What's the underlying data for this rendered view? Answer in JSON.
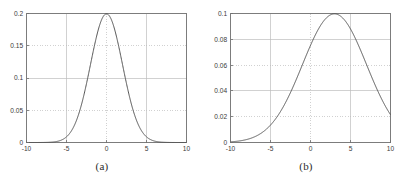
{
  "figure": {
    "panels": [
      {
        "caption": "(a)",
        "chart_data": {
          "type": "line",
          "title": "",
          "xlabel": "",
          "ylabel": "",
          "xlim": [
            -10,
            10
          ],
          "ylim": [
            0,
            0.2
          ],
          "xticks": [
            -10,
            -5,
            0,
            5,
            10
          ],
          "xticklabels": [
            "-10",
            "-5",
            "0",
            "5",
            "10"
          ],
          "yticks": [
            0,
            0.05,
            0.1,
            0.15,
            0.2
          ],
          "yticklabels": [
            "0",
            "0.05",
            "0.1",
            "0.15",
            "0.2"
          ],
          "grid": true,
          "grid_style": "dotted",
          "legend": null,
          "series": [
            {
              "name": "gaussian-pdf-mu0-sigma2",
              "mean": 0,
              "sigma": 2,
              "peak_value": 0.1995,
              "peak_x": 0,
              "color": "#4d4d4d",
              "x": [
                -10,
                -9.5,
                -9,
                -8.5,
                -8,
                -7.5,
                -7,
                -6.5,
                -6,
                -5.5,
                -5,
                -4.5,
                -4,
                -3.5,
                -3,
                -2.5,
                -2,
                -1.5,
                -1,
                -0.5,
                0,
                0.5,
                1,
                1.5,
                2,
                2.5,
                3,
                3.5,
                4,
                4.5,
                5,
                5.5,
                6,
                6.5,
                7,
                7.5,
                8,
                8.5,
                9,
                9.5,
                10
              ],
              "values": [
                0.0001,
                0.0002,
                0.0006,
                0.0014,
                0.0027,
                0.0051,
                0.0088,
                0.0145,
                0.0224,
                0.0325,
                0.044,
                0.0561,
                0.0675,
                0.077,
                0.0833,
                0.0863,
                0.088,
                0.0863,
                0.0833,
                0.077,
                0.1995,
                0.077,
                0.0833,
                0.0863,
                0.088,
                0.0863,
                0.0833,
                0.077,
                0.0675,
                0.0561,
                0.044,
                0.0325,
                0.0224,
                0.0145,
                0.0088,
                0.0051,
                0.0027,
                0.0014,
                0.0006,
                0.0002,
                0.0001
              ]
            }
          ]
        }
      },
      {
        "caption": "(b)",
        "chart_data": {
          "type": "line",
          "title": "",
          "xlabel": "",
          "ylabel": "",
          "xlim": [
            -10,
            10
          ],
          "ylim": [
            0,
            0.1
          ],
          "xticks": [
            -10,
            -5,
            0,
            5,
            10
          ],
          "xticklabels": [
            "-10",
            "-5",
            "0",
            "5",
            "10"
          ],
          "yticks": [
            0,
            0.02,
            0.04,
            0.06,
            0.08,
            0.1
          ],
          "yticklabels": [
            "0",
            "0.02",
            "0.04",
            "0.06",
            "0.08",
            "0.1"
          ],
          "grid": true,
          "grid_style": "dotted",
          "legend": null,
          "series": [
            {
              "name": "gaussian-pdf-mu3-sigma4",
              "mean": 3,
              "sigma": 4,
              "peak_value": 0.0997,
              "peak_x": 3,
              "color": "#4d4d4d",
              "x": [
                -10,
                -9,
                -8,
                -7,
                -6,
                -5,
                -4,
                -3,
                -2,
                -1,
                0,
                1,
                2,
                3,
                4,
                5,
                6,
                7,
                8,
                9,
                10
              ],
              "values": [
                0.0005,
                0.0011,
                0.0022,
                0.004,
                0.007,
                0.0114,
                0.0175,
                0.0252,
                0.0341,
                0.0432,
                0.0513,
                0.0573,
                0.0603,
                0.0997,
                0.0603,
                0.0573,
                0.0513,
                0.0432,
                0.0341,
                0.0252,
                0.0175
              ]
            }
          ]
        }
      }
    ]
  },
  "style": {
    "axis_color": "#6e6e6e",
    "grid_color": "#bdbdbd",
    "curve_color": "#4d4d4d",
    "background": "#ffffff",
    "text_color": "#3a3a3a"
  }
}
